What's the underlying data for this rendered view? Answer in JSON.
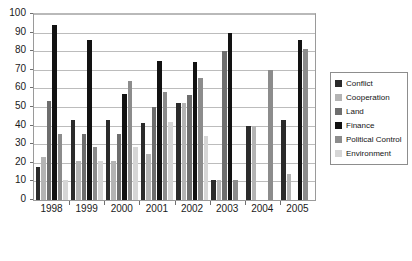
{
  "chart_data": {
    "type": "bar",
    "title": "",
    "subtitle": "",
    "xlabel": "",
    "ylabel": "",
    "ylim": [
      0,
      100
    ],
    "ytick_step": 10,
    "yticks": [
      "0",
      "10",
      "20",
      "30",
      "40",
      "50",
      "60",
      "70",
      "80",
      "90",
      "100"
    ],
    "grid": true,
    "legend_position": "right",
    "categories": [
      "1998",
      "1999",
      "2000",
      "2001",
      "2002",
      "2003",
      "2004",
      "2005"
    ],
    "series": [
      {
        "name": "Conflict",
        "color": "#2b2b2b",
        "values": [
          17.5,
          43,
          43,
          41.5,
          52,
          11,
          40,
          43
        ]
      },
      {
        "name": "Cooperation",
        "color": "#b4b4b4",
        "values": [
          23,
          21,
          21,
          25,
          52,
          11,
          40,
          14
        ]
      },
      {
        "name": "Land",
        "color": "#6e6e6e",
        "values": [
          53,
          35.5,
          35.5,
          50,
          56.5,
          80,
          null,
          null
        ]
      },
      {
        "name": "Finance",
        "color": "#121212",
        "values": [
          94,
          86,
          57,
          75,
          74,
          90,
          null,
          86
        ]
      },
      {
        "name": "Political Control",
        "color": "#8c8c8c",
        "values": [
          35.5,
          28.5,
          64,
          58,
          65.5,
          11,
          70,
          81
        ]
      },
      {
        "name": "Environment",
        "color": "#d6d6d6",
        "values": [
          11,
          21,
          28.5,
          42,
          34.5,
          null,
          null,
          null
        ]
      }
    ]
  },
  "legend": {
    "items": [
      {
        "label": "Conflict"
      },
      {
        "label": "Cooperation"
      },
      {
        "label": "Land"
      },
      {
        "label": "Finance"
      },
      {
        "label": "Political Control"
      },
      {
        "label": "Environment"
      }
    ]
  }
}
